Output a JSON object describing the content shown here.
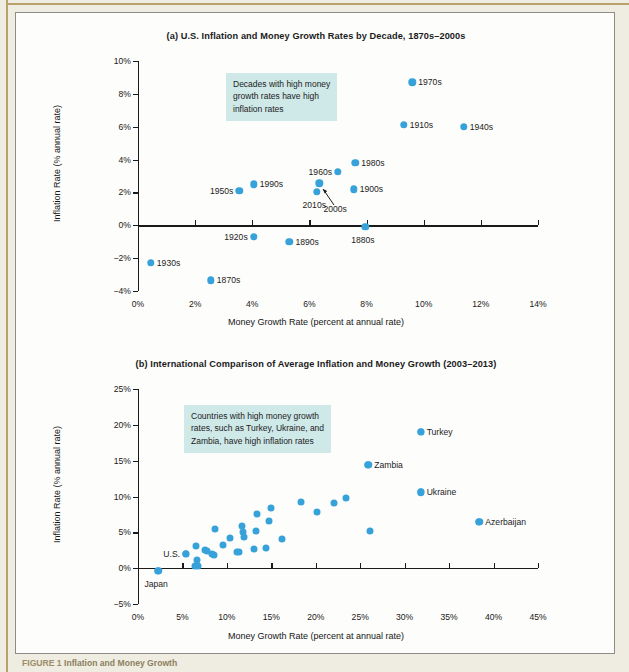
{
  "figure": {
    "caption_number": "FIGURE 1",
    "caption_text": "Inflation and Money Growth",
    "accent_color": "#37a2da",
    "callout_bg": "#cfe8e8",
    "panel_bg": "#fdfdfb"
  },
  "chart_data": [
    {
      "id": "chart-a",
      "type": "scatter",
      "title": "(a) U.S. Inflation and Money Growth Rates by Decade, 1870s–2000s",
      "xlabel": "Money Growth Rate (percent at annual rate)",
      "ylabel": "Inflation Rate (% annual rate)",
      "xlim": [
        0,
        14
      ],
      "ylim": [
        -4,
        10
      ],
      "xticks": [
        "0%",
        "2%",
        "4%",
        "6%",
        "8%",
        "10%",
        "12%",
        "14%"
      ],
      "xtick_values": [
        0,
        2,
        4,
        6,
        8,
        10,
        12,
        14
      ],
      "yticks": [
        "10%",
        "8%",
        "6%",
        "4%",
        "2%",
        "0%",
        "−2%",
        "−4%"
      ],
      "ytick_values": [
        10,
        8,
        6,
        4,
        2,
        0,
        -2,
        -4
      ],
      "grid": false,
      "annotation": [
        "Decades with high money",
        "growth rates have high",
        "inflation rates"
      ],
      "points": [
        {
          "label": "1970s",
          "x": 9.6,
          "y": 8.7,
          "label_side": "right"
        },
        {
          "label": "1910s",
          "x": 9.3,
          "y": 6.1,
          "label_side": "right"
        },
        {
          "label": "1940s",
          "x": 11.4,
          "y": 6.0,
          "label_side": "right"
        },
        {
          "label": "1980s",
          "x": 7.6,
          "y": 3.8,
          "label_side": "right"
        },
        {
          "label": "1960s",
          "x": 7.0,
          "y": 3.25,
          "label_side": "left"
        },
        {
          "label": "1990s",
          "x": 4.05,
          "y": 2.5,
          "label_side": "right"
        },
        {
          "label": "1950s",
          "x": 3.55,
          "y": 2.1,
          "label_side": "left"
        },
        {
          "label": "1900s",
          "x": 7.55,
          "y": 2.2,
          "label_side": "right"
        },
        {
          "label": "2000s",
          "x": 6.35,
          "y": 2.55,
          "label_side": "callout"
        },
        {
          "label": "2010s",
          "x": 6.25,
          "y": 2.05,
          "label_side": "below"
        },
        {
          "label": "1880s",
          "x": 7.95,
          "y": -0.1,
          "label_side": "below"
        },
        {
          "label": "1920s",
          "x": 4.05,
          "y": -0.7,
          "label_side": "left"
        },
        {
          "label": "1890s",
          "x": 5.3,
          "y": -1.0,
          "label_side": "right"
        },
        {
          "label": "1930s",
          "x": 0.45,
          "y": -2.3,
          "label_side": "right"
        },
        {
          "label": "1870s",
          "x": 2.55,
          "y": -3.35,
          "label_side": "right"
        }
      ]
    },
    {
      "id": "chart-b",
      "type": "scatter",
      "title": "(b) International Comparison of Average Inflation and Money Growth (2003–2013)",
      "xlabel": "Money Growth Rate (percent at annual rate)",
      "ylabel": "Inflation Rate (% annual rate)",
      "xlim": [
        0,
        45
      ],
      "ylim": [
        -5,
        25
      ],
      "xticks": [
        "0%",
        "5%",
        "10%",
        "15%",
        "20%",
        "25%",
        "30%",
        "35%",
        "40%",
        "45%"
      ],
      "xtick_values": [
        0,
        5,
        10,
        15,
        20,
        25,
        30,
        35,
        40,
        45
      ],
      "yticks": [
        "25%",
        "20%",
        "15%",
        "10%",
        "5%",
        "0%",
        "−5%"
      ],
      "ytick_values": [
        25,
        20,
        15,
        10,
        5,
        0,
        -5
      ],
      "grid": false,
      "annotation": [
        "Countries with high money growth",
        "rates, such as Turkey, Ukraine, and",
        "Zambia, have high inflation rates"
      ],
      "labeled_points": [
        {
          "label": "Turkey",
          "x": 31.8,
          "y": 19.0,
          "label_side": "right"
        },
        {
          "label": "Zambia",
          "x": 25.9,
          "y": 14.4,
          "label_side": "right"
        },
        {
          "label": "Ukraine",
          "x": 31.8,
          "y": 10.6,
          "label_side": "right"
        },
        {
          "label": "Azerbaijan",
          "x": 38.4,
          "y": 6.5,
          "label_side": "right"
        },
        {
          "label": "U.S.",
          "x": 5.4,
          "y": 2.0,
          "label_side": "left"
        },
        {
          "label": "Japan",
          "x": 2.3,
          "y": -0.4,
          "label_side": "below"
        }
      ],
      "points": [
        {
          "x": 2.3,
          "y": -0.4
        },
        {
          "x": 5.4,
          "y": 2.0
        },
        {
          "x": 6.4,
          "y": 0.3
        },
        {
          "x": 6.5,
          "y": 3.05
        },
        {
          "x": 6.6,
          "y": 1.1
        },
        {
          "x": 6.7,
          "y": 0.35
        },
        {
          "x": 7.5,
          "y": 2.55
        },
        {
          "x": 7.8,
          "y": 2.35
        },
        {
          "x": 8.3,
          "y": 1.95
        },
        {
          "x": 8.6,
          "y": 1.85
        },
        {
          "x": 8.7,
          "y": 5.45
        },
        {
          "x": 9.6,
          "y": 3.3
        },
        {
          "x": 10.3,
          "y": 4.2
        },
        {
          "x": 11.1,
          "y": 2.2
        },
        {
          "x": 11.4,
          "y": 2.25
        },
        {
          "x": 11.7,
          "y": 5.9
        },
        {
          "x": 11.8,
          "y": 5.1
        },
        {
          "x": 11.9,
          "y": 4.3
        },
        {
          "x": 13.1,
          "y": 2.7
        },
        {
          "x": 13.3,
          "y": 5.2
        },
        {
          "x": 13.4,
          "y": 7.5
        },
        {
          "x": 14.4,
          "y": 2.85
        },
        {
          "x": 14.7,
          "y": 6.6
        },
        {
          "x": 15.0,
          "y": 8.4
        },
        {
          "x": 16.2,
          "y": 4.1
        },
        {
          "x": 18.3,
          "y": 9.25
        },
        {
          "x": 20.1,
          "y": 7.9
        },
        {
          "x": 22.0,
          "y": 9.05
        },
        {
          "x": 23.4,
          "y": 9.8
        },
        {
          "x": 25.9,
          "y": 14.4
        },
        {
          "x": 26.1,
          "y": 5.2
        },
        {
          "x": 31.8,
          "y": 19.0
        },
        {
          "x": 31.8,
          "y": 10.6
        },
        {
          "x": 38.4,
          "y": 6.5
        }
      ]
    }
  ]
}
